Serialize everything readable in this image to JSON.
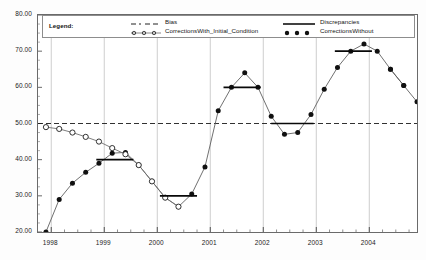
{
  "legend": {
    "title": "Legend:",
    "entries": [
      {
        "label": "Bias",
        "marker": "dashed-line"
      },
      {
        "label": "CorrectionsWith_Initial_Condition",
        "marker": "open-circle-line"
      },
      {
        "label": "Discrepancies",
        "marker": "solid-line"
      },
      {
        "label": "CorrectionsWithout",
        "marker": "filled-circle-line"
      }
    ]
  },
  "chart_data": {
    "type": "line",
    "title": "",
    "xlabel": "",
    "ylabel": "",
    "xlim": [
      1997.75,
      2004.9
    ],
    "ylim": [
      20.0,
      80.0
    ],
    "grid": "vertical-year-gridlines",
    "legend_position": "top-inside",
    "ytick_labels": [
      "20.00",
      "30.00",
      "40.00",
      "50.00",
      "60.00",
      "70.00",
      "80.00"
    ],
    "ytick_values": [
      20,
      30,
      40,
      50,
      60,
      70,
      80
    ],
    "xtick_labels": [
      "1998",
      "1999",
      "2000",
      "2001",
      "2002",
      "2003",
      "2004"
    ],
    "xtick_values": [
      1998,
      1999,
      2000,
      2001,
      2002,
      2003,
      2004
    ],
    "series": [
      {
        "name": "Bias",
        "style": "dashed-horizontal",
        "value": 50.0,
        "x": [
          1997.75,
          2004.9
        ],
        "values": [
          50.0,
          50.0
        ]
      },
      {
        "name": "CorrectionsWith_Initial_Condition",
        "style": "open-circle-line",
        "x": [
          1997.9,
          1998.15,
          1998.4,
          1998.65,
          1998.9,
          1999.15,
          1999.4,
          1999.65,
          1999.9,
          2000.15,
          2000.4
        ],
        "values": [
          49.0,
          48.5,
          47.5,
          46.3,
          45.0,
          43.2,
          41.5,
          38.5,
          34.0,
          29.5,
          27.0
        ]
      },
      {
        "name": "CorrectionsWithout",
        "style": "filled-circle-line",
        "x": [
          1997.9,
          1998.15,
          1998.4,
          1998.65,
          1998.9,
          1999.15,
          1999.4,
          1999.65,
          1999.9,
          2000.15,
          2000.4,
          2000.65,
          2000.9,
          2001.15,
          2001.4,
          2001.65,
          2001.9,
          2002.15,
          2002.4,
          2002.65,
          2002.9,
          2003.15,
          2003.4,
          2003.65,
          2003.9,
          2004.15,
          2004.4,
          2004.65
        ],
        "values": [
          20.0,
          29.0,
          33.5,
          36.5,
          39.0,
          41.8,
          42.0,
          38.5,
          34.0,
          29.5,
          27.0,
          30.5,
          38.0,
          53.5,
          60.0,
          64.0,
          60.0,
          52.0,
          47.0,
          47.5,
          52.5,
          59.5,
          65.5,
          70.0,
          72.0,
          70.0,
          65.0,
          60.5
        ]
      },
      {
        "name": "CorrectionsWithout_tail",
        "style": "filled-circle-line",
        "x": [
          2004.4,
          2004.65,
          2004.9
        ],
        "values": [
          65.0,
          60.5,
          56.0
        ]
      },
      {
        "name": "Discrepancies",
        "style": "horizontal-step-segments",
        "segments": [
          {
            "x_start": 1998.85,
            "x_end": 1999.55,
            "value": 40.0
          },
          {
            "x_start": 2000.05,
            "x_end": 2000.75,
            "value": 30.0
          },
          {
            "x_start": 2001.25,
            "x_end": 2001.95,
            "value": 60.0
          },
          {
            "x_start": 2002.15,
            "x_end": 2002.95,
            "value": 50.0
          },
          {
            "x_start": 2003.35,
            "x_end": 2004.05,
            "value": 70.0
          }
        ]
      }
    ]
  }
}
